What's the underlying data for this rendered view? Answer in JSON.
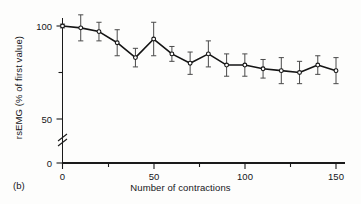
{
  "figure": {
    "panel_label": "(b)",
    "background": "#fdfdfc",
    "ink_color": "#1a1a1a"
  },
  "chart_data": {
    "type": "line",
    "title": "",
    "subtitle": "",
    "xlabel": "Number of contractions",
    "ylabel": "rsEMG (% of first value)",
    "x": [
      0,
      10,
      20,
      30,
      40,
      50,
      60,
      70,
      80,
      90,
      100,
      110,
      120,
      130,
      140,
      150
    ],
    "values": [
      100,
      99,
      97,
      91,
      83,
      93,
      85,
      80,
      85,
      79,
      79,
      77,
      76,
      75,
      79,
      76
    ],
    "errors_upper": [
      1,
      7,
      5,
      7,
      5,
      9,
      4,
      6,
      7,
      6,
      6,
      5,
      7,
      6,
      5,
      7
    ],
    "errors_lower": [
      1,
      7,
      5,
      7,
      5,
      9,
      4,
      6,
      7,
      6,
      6,
      5,
      7,
      6,
      5,
      7
    ],
    "error_type": "error-bar",
    "marker": "open-circle",
    "line_style": "solid",
    "grid": false,
    "legend": null,
    "xlim": [
      0,
      150
    ],
    "ylim": [
      0,
      105
    ],
    "xticks": [
      0,
      50,
      100,
      150
    ],
    "xticklabels": [
      "0",
      "50",
      "100",
      "150"
    ],
    "xminorticks": [
      25,
      75,
      125
    ],
    "yticks": [
      0,
      50,
      100
    ],
    "yticklabels": [
      "0",
      "50",
      "100"
    ],
    "yminorticks": [
      75
    ],
    "axis_break": {
      "axis": "y",
      "between": [
        0,
        50
      ],
      "symbol": "double-slash"
    }
  },
  "axes": {
    "x_tick_labels": [
      "0",
      "50",
      "100",
      "150"
    ],
    "y_tick_labels": [
      "0",
      "50",
      "100"
    ]
  }
}
